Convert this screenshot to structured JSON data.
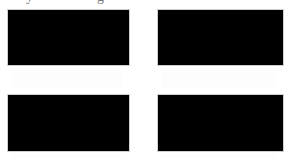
{
  "header": {
    "cutoff_text_left": "y",
    "cutoff_text_right": "g"
  },
  "grid": {
    "thumbnails": [
      {
        "position": "top-left",
        "caption": ""
      },
      {
        "position": "top-right",
        "caption": ""
      },
      {
        "position": "bottom-left",
        "caption": ""
      },
      {
        "position": "bottom-right",
        "caption": ""
      }
    ],
    "thumbnail_color": "#000000"
  }
}
